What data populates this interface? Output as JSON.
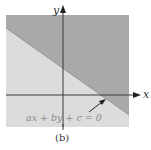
{
  "figure": {
    "caption": "(b)",
    "x_axis_label": "x",
    "y_axis_label": "y",
    "line_label": "ax + by + c = 0",
    "colors": {
      "background": "#ffffff",
      "upper_region": "#a9a9a9",
      "lower_region": "#dcdcdc",
      "axis": "#3a3a3a",
      "label_text": "#8a8a8a",
      "axis_label_text": "#333333"
    },
    "regions": [
      {
        "name": "half-plane above line",
        "shade": "dark gray"
      },
      {
        "name": "half-plane below line",
        "shade": "light gray"
      }
    ]
  }
}
